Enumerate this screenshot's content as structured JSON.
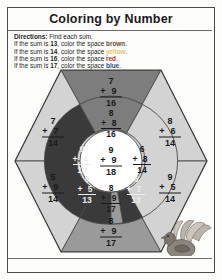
{
  "page": {
    "title": "Coloring by Number"
  },
  "directions": {
    "label": "Directions:",
    "intro": " Find each sum.",
    "rules": [
      {
        "prefix": "If the sum is ",
        "number": "13",
        "mid": ", color the space ",
        "color_word": "brown",
        "suffix": ".",
        "color_hex": "#6b4a2a",
        "swatch_class": "sw-brown"
      },
      {
        "prefix": "If the sum is ",
        "number": "14",
        "mid": ", color the space ",
        "color_word": "yellow",
        "suffix": ".",
        "color_hex": "#d9c66a",
        "swatch_class": "sw-yellow"
      },
      {
        "prefix": "If the sum is ",
        "number": "16",
        "mid": ", color the space ",
        "color_word": "red",
        "suffix": ".",
        "color_hex": "#a8312b",
        "swatch_class": "sw-red"
      },
      {
        "prefix": "If the sum is ",
        "number": "17",
        "mid": ", color the space ",
        "color_word": "blue",
        "suffix": ".",
        "color_hex": "#2a4a8c",
        "swatch_class": "sw-blue"
      }
    ]
  },
  "legend": {
    "brown": "#3a3a3a",
    "yellow": "#d3d3d3",
    "red": "#7d7d7d",
    "blue": "#9a9a9a",
    "center": "#ffffff"
  },
  "puzzle": {
    "shape": "hexagon",
    "regions": [
      {
        "id": "outer-left",
        "ring": "outer",
        "addend1": "7",
        "addend2": "7",
        "sum": "14",
        "color_name": "yellow",
        "fill": "#d3d3d3",
        "text": "dark"
      },
      {
        "id": "outer-top-right",
        "ring": "outer",
        "addend1": "8",
        "addend2": "6",
        "sum": "14",
        "color_name": "yellow",
        "fill": "#d3d3d3",
        "text": "dark"
      },
      {
        "id": "outer-bottom-left",
        "ring": "outer",
        "addend1": "5",
        "addend2": "9",
        "sum": "14",
        "color_name": "yellow",
        "fill": "#d3d3d3",
        "text": "dark"
      },
      {
        "id": "outer-bottom-right",
        "ring": "outer",
        "addend1": "9",
        "addend2": "5",
        "sum": "14",
        "color_name": "yellow",
        "fill": "#d3d3d3",
        "text": "dark"
      },
      {
        "id": "wedge-top",
        "ring": "outer",
        "addend1": "7",
        "addend2": "9",
        "sum": "16",
        "color_name": "red",
        "fill": "#7d7d7d",
        "text": "dark"
      },
      {
        "id": "wedge-bottom",
        "ring": "outer",
        "addend1": "8",
        "addend2": "9",
        "sum": "17",
        "color_name": "blue",
        "fill": "#9a9a9a",
        "text": "dark"
      },
      {
        "id": "ring-top",
        "ring": "middle",
        "addend1": "8",
        "addend2": "8",
        "sum": "16",
        "color_name": "red",
        "fill": "#7d7d7d",
        "text": "dark"
      },
      {
        "id": "ring-left",
        "ring": "middle",
        "addend1": "9",
        "addend2": "4",
        "sum": "13",
        "color_name": "brown",
        "fill": "#3a3a3a",
        "text": "light"
      },
      {
        "id": "ring-right",
        "ring": "middle",
        "addend1": "6",
        "addend2": "8",
        "sum": "14",
        "color_name": "yellow",
        "fill": "#d3d3d3",
        "text": "dark"
      },
      {
        "id": "ring-bottom-left",
        "ring": "middle",
        "addend1": "8",
        "addend2": "5",
        "sum": "13",
        "color_name": "brown",
        "fill": "#3a3a3a",
        "text": "light"
      },
      {
        "id": "ring-bottom-right",
        "ring": "middle",
        "addend1": "6",
        "addend2": "7",
        "sum": "13",
        "color_name": "brown",
        "fill": "#3a3a3a",
        "text": "light"
      },
      {
        "id": "ring-bottom",
        "ring": "middle",
        "addend1": "8",
        "addend2": "9",
        "sum": "17",
        "color_name": "blue",
        "fill": "#9a9a9a",
        "text": "dark"
      },
      {
        "id": "center",
        "ring": "center",
        "addend1": "9",
        "addend2": "9",
        "sum": "18",
        "color_name": "white",
        "fill": "#ffffff",
        "text": "dark"
      }
    ]
  },
  "illustration": {
    "name": "turkey",
    "alt": "turkey"
  }
}
